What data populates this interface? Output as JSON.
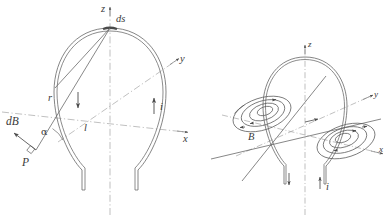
{
  "figure": {
    "title": "",
    "panels": [
      {
        "id": "left-panel",
        "name": "biot-savart-single-element",
        "axes": [
          {
            "name": "z-axis",
            "label": "z"
          },
          {
            "name": "y-axis",
            "label": "y"
          },
          {
            "name": "x-axis",
            "label": "x"
          }
        ],
        "labels": {
          "ds": "ds",
          "r": "r",
          "alpha": "α",
          "dB": "dB",
          "P": "P",
          "l": "l",
          "i": "i"
        }
      },
      {
        "id": "right-panel",
        "name": "magnetic-field-lines-of-loop",
        "axes": [
          {
            "name": "z-axis",
            "label": "z"
          },
          {
            "name": "y-axis",
            "label": "y"
          },
          {
            "name": "x-axis",
            "label": "x"
          }
        ],
        "labels": {
          "B": "B",
          "i": "i"
        }
      }
    ],
    "colors": {
      "ink": "#3a3a3a",
      "line": "#6b6b6b",
      "axis_dash": "#9a9a9a",
      "background": "#ffffff"
    }
  }
}
